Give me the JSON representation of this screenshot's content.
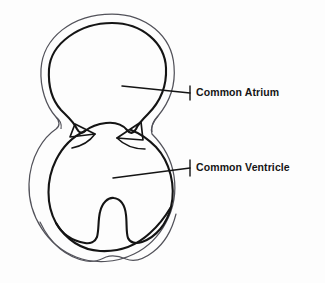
{
  "figure": {
    "type": "anatomical-line-diagram",
    "background_color": "#fdfdfd",
    "ink_color": "#141414",
    "outer_wall_color": "#4a4a4a"
  },
  "labels": {
    "atrium": {
      "text": "Common Atrium",
      "x": 196,
      "y": 87
    },
    "ventricle": {
      "text": "Common Ventricle",
      "x": 196,
      "y": 162
    }
  },
  "leaders": {
    "atrium": {
      "start_x": 122,
      "start_y": 86,
      "end_x": 190,
      "end_y": 93,
      "tick_top_y": 86,
      "tick_bottom_y": 100
    },
    "ventricle": {
      "start_x": 113,
      "start_y": 178,
      "end_x": 190,
      "end_y": 168,
      "tick_top_y": 160,
      "tick_bottom_y": 176
    }
  },
  "structures": {
    "common_atrium": "upper rounded chamber",
    "common_ventricle": "lower rounded chamber",
    "valve_cusp_left": "triangular atrioventricular valve leaflet, left",
    "valve_cusp_right": "triangular atrioventricular valve leaflet, right",
    "septal_remnant": "rounded muscular ridge rising from ventricular floor",
    "apex": "gently lobed lower border"
  }
}
